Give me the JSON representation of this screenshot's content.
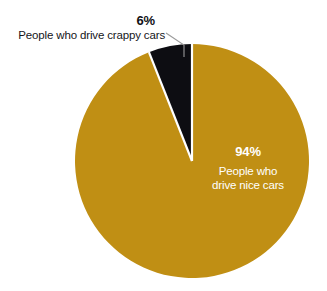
{
  "background_color": "#ffffff",
  "chart_data": {
    "type": "pie",
    "title": "",
    "subtitle": "",
    "xlabel": "",
    "ylabel": "",
    "legend_position": "none",
    "grid": false,
    "center": {
      "x": 192,
      "y": 161
    },
    "radius": 117,
    "start_angle_deg": 0,
    "direction": "clockwise",
    "separator_color": "#ffffff",
    "categories": [
      "People who drive nice cars",
      "People who drive crappy cars"
    ],
    "values": [
      94,
      6
    ],
    "colors": [
      "#c08f14",
      "#0d0d12"
    ],
    "slices": [
      {
        "label": "People who drive nice cars",
        "value": 94,
        "value_label": "94%",
        "color": "#c08f14",
        "label_color": "#ffffff",
        "label_placement": "inside",
        "label_line_1": "People who",
        "label_line_2": "drive nice cars"
      },
      {
        "label": "People who drive crappy cars",
        "value": 6,
        "value_label": "6%",
        "color": "#0d0d12",
        "label_color": "#15151a",
        "label_placement": "callout-left",
        "leader_line_color": "#9a9a9a"
      }
    ]
  },
  "callout": {
    "percent": "6%",
    "description": "People who drive crappy cars"
  },
  "inside_label": {
    "percent": "94%",
    "line1": "People who",
    "line2": "drive nice cars"
  }
}
